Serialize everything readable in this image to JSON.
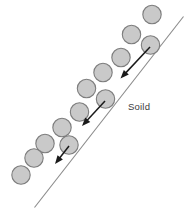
{
  "figure": {
    "canvas": {
      "width": 192,
      "height": 213,
      "background": "#ffffff"
    },
    "labels": [
      {
        "id": "solid-label",
        "text": "Soild",
        "x": 128,
        "y": 107
      }
    ],
    "colors": {
      "circle_fill": "#c9c9c9",
      "circle_stroke": "#7d7d7d",
      "line_stroke": "#8a8a8a",
      "arrow_stroke": "#1a1a1a",
      "label_text": "#3c3c3c",
      "background": "#ffffff"
    },
    "boundary": {
      "name": "solid-boundary-line",
      "x1": 183.5,
      "y1": 16.5,
      "x2": 34.5,
      "y2": 207.5,
      "stroke": "#8a8a8a"
    },
    "circle_radius": 9.2,
    "circles": [
      {
        "id": "c1",
        "row": "upper",
        "cx": 152.0,
        "cy": 14.5
      },
      {
        "id": "c2",
        "row": "upper",
        "cx": 131.5,
        "cy": 34.5
      },
      {
        "id": "c3",
        "row": "upper",
        "cx": 121.0,
        "cy": 57.5
      },
      {
        "id": "c4",
        "row": "upper",
        "cx": 103.0,
        "cy": 72.5
      },
      {
        "id": "c5",
        "row": "upper",
        "cx": 86.5,
        "cy": 88.5
      },
      {
        "id": "c6",
        "row": "upper",
        "cx": 79.5,
        "cy": 112.0
      },
      {
        "id": "c7",
        "row": "upper",
        "cx": 62.0,
        "cy": 127.5
      },
      {
        "id": "c8",
        "row": "upper",
        "cx": 45.0,
        "cy": 143.5
      },
      {
        "id": "c9",
        "row": "upper",
        "cx": 34.0,
        "cy": 158.0
      },
      {
        "id": "c10",
        "row": "upper",
        "cx": 21.0,
        "cy": 175.0
      },
      {
        "id": "b1",
        "row": "boundary",
        "cx": 150.5,
        "cy": 45.0
      },
      {
        "id": "b2",
        "row": "boundary",
        "cx": 105.5,
        "cy": 99.0
      },
      {
        "id": "b3",
        "row": "boundary",
        "cx": 69.0,
        "cy": 145.0
      }
    ],
    "arrows": [
      {
        "id": "arrow-top",
        "name": "flux-arrow-top",
        "x1": 150.0,
        "y1": 47.0,
        "x2": 120.5,
        "y2": 78.5
      },
      {
        "id": "arrow-middle",
        "name": "flux-arrow-middle",
        "x1": 105.0,
        "y1": 101.0,
        "x2": 82.0,
        "y2": 126.0
      },
      {
        "id": "arrow-bottom",
        "name": "flux-arrow-bottom",
        "x1": 69.0,
        "y1": 146.0,
        "x2": 55.0,
        "y2": 164.0
      }
    ]
  }
}
